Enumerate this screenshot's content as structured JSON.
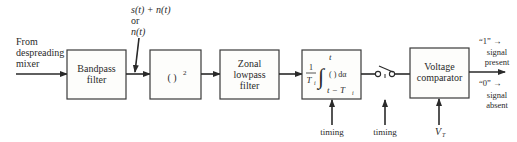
{
  "input_label": [
    "From",
    "despreading",
    "mixer"
  ],
  "signal_annotation": [
    "s(t) + n(t)",
    "or",
    "n(t)"
  ],
  "blocks": {
    "bandpass": [
      "Bandpass",
      "filter"
    ],
    "square": "( )",
    "square_exp": "2",
    "lowpass": [
      "Zonal",
      "lowpass",
      "filter"
    ],
    "integrator": {
      "frac_num": "1",
      "frac_den": "T",
      "frac_den_sub": "i",
      "upper_limit": "t",
      "integrand": "( ) dα",
      "lower_limit": "t − T",
      "lower_limit_sub": "i"
    },
    "comparator": [
      "Voltage",
      "comparator"
    ]
  },
  "controls": {
    "integrator_timing": "timing",
    "switch_timing": "timing",
    "threshold": "V",
    "threshold_sub": "T"
  },
  "outputs": {
    "one": "“1” →",
    "one_desc": [
      "signal",
      "present"
    ],
    "zero": "“0” →",
    "zero_desc": [
      "signal",
      "absent"
    ]
  }
}
